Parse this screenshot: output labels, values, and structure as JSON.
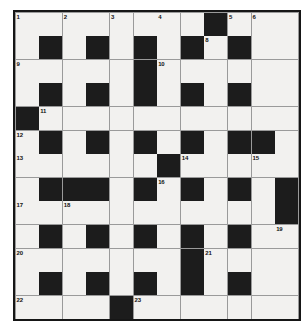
{
  "puzzle": {
    "type": "crossword-grid",
    "title": "Crossword Puzzle Grid",
    "columns": 12,
    "rows": 13,
    "cell_size_px": 23,
    "colors": {
      "block": "#1c1c1c",
      "open": "#f2f1ef",
      "gridline": "#9a9a9a",
      "border": "#161616",
      "number_text": "#111111",
      "page_background": "#ffffff"
    },
    "legend": {
      "block_label": "blocked-square",
      "open_label": "open-square"
    },
    "grid": [
      [
        "1",
        "",
        "2",
        "",
        "3",
        "",
        "4",
        "",
        "#",
        "5",
        "6",
        "",
        "7"
      ],
      [
        "",
        "#",
        "",
        "#",
        "",
        "#",
        "",
        "#",
        "8",
        "#",
        "",
        "#",
        ""
      ],
      [
        "9",
        "",
        "",
        "",
        "",
        "#",
        "10",
        "",
        "",
        "",
        "",
        ""
      ],
      [
        "",
        "#",
        "",
        "#",
        "",
        "#",
        "",
        "#",
        "",
        "#",
        "",
        "#"
      ],
      [
        "#",
        "11",
        "",
        "",
        "",
        "",
        "",
        "",
        "",
        "",
        "",
        ""
      ],
      [
        "12",
        "#",
        "",
        "#",
        "",
        "#",
        "",
        "#",
        "",
        "#",
        "#",
        ""
      ],
      [
        "13",
        "",
        "",
        "",
        "",
        "",
        "#",
        "14",
        "",
        "",
        "15",
        ""
      ],
      [
        "",
        "#",
        "#",
        "#",
        "",
        "#",
        "16",
        "#",
        "",
        "#",
        "",
        "#"
      ],
      [
        "17",
        "",
        "18",
        "",
        "",
        "",
        "",
        "",
        "",
        "",
        "",
        "#"
      ],
      [
        "",
        "#",
        "",
        "#",
        "",
        "#",
        "",
        "#",
        "",
        "#",
        "",
        "19"
      ],
      [
        "20",
        "",
        "",
        "",
        "",
        "",
        "",
        "#",
        "21",
        "",
        "",
        ""
      ],
      [
        "",
        "#",
        "",
        "#",
        "",
        "#",
        "",
        "#",
        "",
        "#",
        "",
        "#"
      ],
      [
        "22",
        "",
        "",
        "",
        "#",
        "23",
        "",
        "",
        "",
        "",
        "",
        ""
      ]
    ],
    "blocks": [
      {
        "row": 1,
        "col": 9
      },
      {
        "row": 2,
        "col": 2
      },
      {
        "row": 2,
        "col": 4
      },
      {
        "row": 2,
        "col": 6
      },
      {
        "row": 2,
        "col": 8
      },
      {
        "row": 2,
        "col": 10
      },
      {
        "row": 3,
        "col": 6
      },
      {
        "row": 4,
        "col": 2
      },
      {
        "row": 4,
        "col": 4
      },
      {
        "row": 4,
        "col": 6
      },
      {
        "row": 4,
        "col": 8
      },
      {
        "row": 4,
        "col": 10
      },
      {
        "row": 5,
        "col": 1
      },
      {
        "row": 6,
        "col": 2
      },
      {
        "row": 6,
        "col": 4
      },
      {
        "row": 6,
        "col": 6
      },
      {
        "row": 6,
        "col": 8
      },
      {
        "row": 6,
        "col": 10
      },
      {
        "row": 6,
        "col": 11
      },
      {
        "row": 7,
        "col": 7
      },
      {
        "row": 8,
        "col": 2
      },
      {
        "row": 8,
        "col": 3
      },
      {
        "row": 8,
        "col": 4
      },
      {
        "row": 8,
        "col": 6
      },
      {
        "row": 8,
        "col": 8
      },
      {
        "row": 8,
        "col": 10
      },
      {
        "row": 8,
        "col": 12
      },
      {
        "row": 9,
        "col": 12
      },
      {
        "row": 10,
        "col": 2
      },
      {
        "row": 10,
        "col": 4
      },
      {
        "row": 10,
        "col": 6
      },
      {
        "row": 10,
        "col": 8
      },
      {
        "row": 10,
        "col": 10
      },
      {
        "row": 11,
        "col": 8
      },
      {
        "row": 12,
        "col": 2
      },
      {
        "row": 12,
        "col": 4
      },
      {
        "row": 12,
        "col": 6
      },
      {
        "row": 12,
        "col": 8
      },
      {
        "row": 12,
        "col": 10
      },
      {
        "row": 13,
        "col": 5
      }
    ],
    "numbers": [
      {
        "n": "1",
        "row": 1,
        "col": 1
      },
      {
        "n": "2",
        "row": 1,
        "col": 3
      },
      {
        "n": "3",
        "row": 1,
        "col": 5
      },
      {
        "n": "4",
        "row": 1,
        "col": 7
      },
      {
        "n": "5",
        "row": 1,
        "col": 10
      },
      {
        "n": "6",
        "row": 1,
        "col": 11
      },
      {
        "n": "7",
        "row": 1,
        "col": 13
      },
      {
        "n": "8",
        "row": 2,
        "col": 9
      },
      {
        "n": "9",
        "row": 3,
        "col": 1
      },
      {
        "n": "10",
        "row": 3,
        "col": 7
      },
      {
        "n": "11",
        "row": 5,
        "col": 2
      },
      {
        "n": "12",
        "row": 6,
        "col": 1
      },
      {
        "n": "13",
        "row": 7,
        "col": 1
      },
      {
        "n": "14",
        "row": 7,
        "col": 8
      },
      {
        "n": "15",
        "row": 7,
        "col": 11
      },
      {
        "n": "16",
        "row": 8,
        "col": 7
      },
      {
        "n": "17",
        "row": 9,
        "col": 1
      },
      {
        "n": "18",
        "row": 9,
        "col": 3
      },
      {
        "n": "19",
        "row": 10,
        "col": 12
      },
      {
        "n": "20",
        "row": 11,
        "col": 1
      },
      {
        "n": "21",
        "row": 11,
        "col": 9
      },
      {
        "n": "22",
        "row": 13,
        "col": 1
      },
      {
        "n": "23",
        "row": 13,
        "col": 6
      }
    ]
  }
}
